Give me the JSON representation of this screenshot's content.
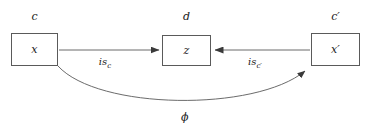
{
  "diagram": {
    "background_color": "#ffffff",
    "stroke_color": "#5a5a5a",
    "text_color": "#1a1a1a",
    "nodes": [
      {
        "id": "left",
        "category_label": "c",
        "object_label": "x",
        "x": 11,
        "y": 33,
        "w": 47,
        "h": 33,
        "category_x": 34,
        "category_y": 17
      },
      {
        "id": "middle",
        "category_label": "d",
        "object_label": "z",
        "x": 162,
        "y": 35,
        "w": 49,
        "h": 31,
        "category_x": 186,
        "category_y": 17
      },
      {
        "id": "right",
        "category_label": "c′",
        "object_label": "x′",
        "x": 311,
        "y": 33,
        "w": 49,
        "h": 33,
        "category_x": 335,
        "category_y": 17
      }
    ],
    "edges": [
      {
        "id": "is-c",
        "label_base": "is",
        "label_sub": "c",
        "from": "left",
        "to": "middle",
        "x1": 59,
        "y1": 50,
        "x2": 161,
        "y2": 50,
        "label_x": 105,
        "label_y": 62
      },
      {
        "id": "is-c-prime",
        "label_base": "is",
        "label_sub": "c′",
        "from": "right",
        "to": "middle",
        "x1": 310,
        "y1": 50,
        "x2": 213,
        "y2": 50,
        "label_x": 255,
        "label_y": 62
      },
      {
        "id": "phi",
        "label_base": "ϕ",
        "label_sub": "",
        "from": "left",
        "to": "right",
        "path": "M 58 66 C 100 112, 260 112, 307 70",
        "label_x": 181,
        "label_y": 118
      }
    ]
  }
}
